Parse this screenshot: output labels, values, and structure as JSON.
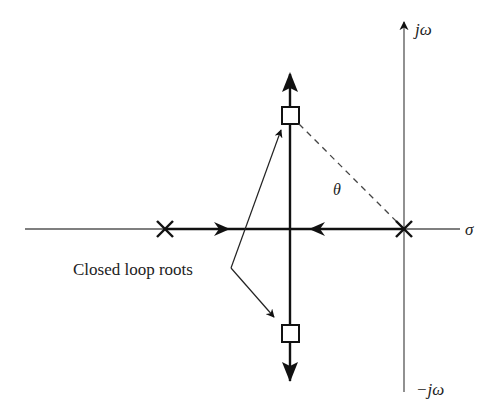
{
  "diagram": {
    "type": "root-locus",
    "axes": {
      "real_axis_label": "σ",
      "imag_axis_pos_label": "jω",
      "imag_axis_neg_label": "−jω"
    },
    "annotation": {
      "label": "Closed loop roots",
      "angle_label": "θ"
    },
    "poles": [
      {
        "name": "left-pole",
        "symbol": "×"
      },
      {
        "name": "right-pole",
        "symbol": "×"
      }
    ],
    "closed_loop_roots": [
      {
        "name": "upper-root",
        "symbol": "□"
      },
      {
        "name": "lower-root",
        "symbol": "□"
      }
    ],
    "colors": {
      "axis": "#555555",
      "locus": "#111111",
      "text": "#222222"
    }
  }
}
